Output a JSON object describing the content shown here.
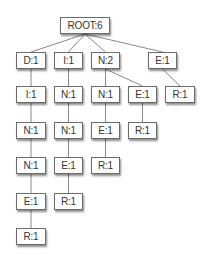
{
  "diagram": {
    "type": "tree",
    "nodes": [
      {
        "id": "root",
        "label": "ROOT:6",
        "x": 60,
        "y": 17,
        "w": 50
      },
      {
        "id": "d",
        "label": "D:1",
        "x": 16,
        "y": 52,
        "w": 30,
        "parent": "root"
      },
      {
        "id": "i",
        "label": "I:1",
        "x": 54,
        "y": 52,
        "w": 29,
        "parent": "root"
      },
      {
        "id": "n",
        "label": "N:2",
        "x": 91,
        "y": 52,
        "w": 29,
        "parent": "root"
      },
      {
        "id": "e",
        "label": "E:1",
        "x": 148,
        "y": 52,
        "w": 29,
        "parent": "root"
      },
      {
        "id": "di",
        "label": "I:1",
        "x": 16,
        "y": 86,
        "w": 30,
        "parent": "d"
      },
      {
        "id": "dn1",
        "label": "N:1",
        "x": 16,
        "y": 122,
        "w": 30,
        "parent": "di"
      },
      {
        "id": "dn2",
        "label": "N:1",
        "x": 16,
        "y": 157,
        "w": 30,
        "parent": "dn1"
      },
      {
        "id": "de",
        "label": "E:1",
        "x": 16,
        "y": 193,
        "w": 30,
        "parent": "dn2"
      },
      {
        "id": "dr",
        "label": "R:1",
        "x": 16,
        "y": 228,
        "w": 30,
        "parent": "de"
      },
      {
        "id": "in1",
        "label": "N:1",
        "x": 54,
        "y": 86,
        "w": 29,
        "parent": "i"
      },
      {
        "id": "in2",
        "label": "N:1",
        "x": 54,
        "y": 122,
        "w": 29,
        "parent": "in1"
      },
      {
        "id": "ie",
        "label": "E:1",
        "x": 54,
        "y": 157,
        "w": 29,
        "parent": "in2"
      },
      {
        "id": "ir",
        "label": "R:1",
        "x": 54,
        "y": 193,
        "w": 29,
        "parent": "ie"
      },
      {
        "id": "nn",
        "label": "N:1",
        "x": 91,
        "y": 86,
        "w": 29,
        "parent": "n"
      },
      {
        "id": "nne",
        "label": "E:1",
        "x": 91,
        "y": 122,
        "w": 29,
        "parent": "nn"
      },
      {
        "id": "nner",
        "label": "R:1",
        "x": 91,
        "y": 157,
        "w": 29,
        "parent": "nne"
      },
      {
        "id": "ne",
        "label": "E:1",
        "x": 128,
        "y": 86,
        "w": 29,
        "parent": "n"
      },
      {
        "id": "ner",
        "label": "R:1",
        "x": 128,
        "y": 122,
        "w": 29,
        "parent": "ne"
      },
      {
        "id": "er",
        "label": "R:1",
        "x": 165,
        "y": 86,
        "w": 30,
        "parent": "e"
      }
    ],
    "colors": {
      "edge": "#8a8a8a",
      "border": "#6b6b6b",
      "text": "#333333",
      "background": "#ffffff"
    }
  }
}
